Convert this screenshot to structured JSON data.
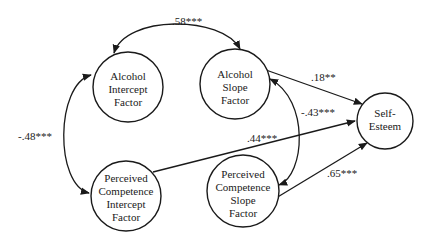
{
  "diagram": {
    "type": "path-model",
    "nodes": [
      {
        "id": "alcohol_intercept",
        "lines": [
          "Alcohol",
          "Intercept",
          "Factor"
        ]
      },
      {
        "id": "alcohol_slope",
        "lines": [
          "Alcohol",
          "Slope",
          "Factor"
        ]
      },
      {
        "id": "self_esteem",
        "lines": [
          "Self-",
          "Esteem"
        ]
      },
      {
        "id": "pc_intercept",
        "lines": [
          "Perceived",
          "Competence",
          "Intercept",
          "Factor"
        ]
      },
      {
        "id": "pc_slope",
        "lines": [
          "Perceived",
          "Competence",
          "Slope",
          "Factor"
        ]
      }
    ],
    "edges": [
      {
        "id": "ai_as",
        "from": "alcohol_intercept",
        "to": "alcohol_slope",
        "kind": "covariance",
        "label": ".58***"
      },
      {
        "id": "ai_pci",
        "from": "alcohol_intercept",
        "to": "pc_intercept",
        "kind": "covariance",
        "label": "-.48***"
      },
      {
        "id": "as_pcs",
        "from": "alcohol_slope",
        "to": "pc_slope",
        "kind": "covariance",
        "label": "-.43***"
      },
      {
        "id": "as_se",
        "from": "alcohol_slope",
        "to": "self_esteem",
        "kind": "path",
        "label": ".18**"
      },
      {
        "id": "pci_se",
        "from": "pc_intercept",
        "to": "self_esteem",
        "kind": "path",
        "label": ".44***"
      },
      {
        "id": "pcs_se",
        "from": "pc_slope",
        "to": "self_esteem",
        "kind": "path",
        "label": ".65***"
      }
    ]
  }
}
